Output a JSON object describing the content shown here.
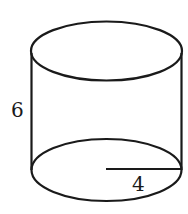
{
  "figure": {
    "shape": "cylinder",
    "height_label": "6",
    "radius_label": "4",
    "stroke_color": "#1a1a1a",
    "background": "#ffffff"
  }
}
